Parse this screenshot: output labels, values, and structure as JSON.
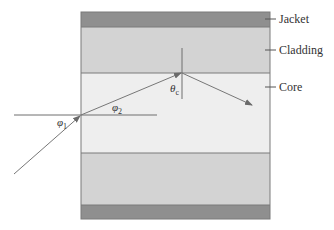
{
  "figure": {
    "layers": [
      {
        "name": "Jacket",
        "color": "#8f8f8f"
      },
      {
        "name": "Cladding",
        "color": "#d3d3d3"
      },
      {
        "name": "Core",
        "color": "#eeeeee"
      }
    ],
    "labels": {
      "jacket": "Jacket",
      "cladding": "Cladding",
      "core": "Core"
    },
    "angles": {
      "phi1": {
        "symbol": "φ",
        "sub": "1"
      },
      "phi2": {
        "symbol": "φ",
        "sub": "2"
      },
      "theta_c": {
        "symbol": "θ",
        "sub": "c"
      }
    },
    "colors": {
      "line": "#6e6e6e",
      "ray": "#777777",
      "border": "#7a7a7a"
    }
  }
}
